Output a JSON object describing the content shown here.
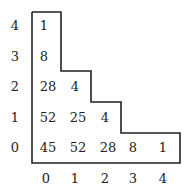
{
  "diagram": {
    "type": "staircase-table",
    "y_labels": [
      "4",
      "3",
      "2",
      "1",
      "0"
    ],
    "x_labels": [
      "0",
      "1",
      "2",
      "3",
      "4"
    ],
    "rows": [
      [
        "1"
      ],
      [
        "8"
      ],
      [
        "28",
        "4"
      ],
      [
        "52",
        "25",
        "4"
      ],
      [
        "45",
        "52",
        "28",
        "8",
        "1"
      ]
    ],
    "line_color": "#222222"
  }
}
